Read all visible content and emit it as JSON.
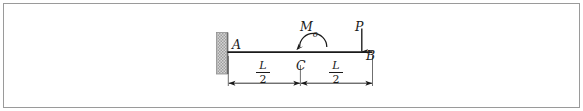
{
  "figure": {
    "type": "cantilever-beam-free-body-diagram",
    "background_color": "#ffffff",
    "frame_color": "#9a9a9a",
    "ink_color": "#1a1a1a",
    "wall_fill_color": "#b8b8b8",
    "wall_edge_color": "#6e6e6e"
  },
  "points": {
    "a_label": "A",
    "b_label": "B",
    "c_label": "C"
  },
  "loads": {
    "moment_symbol": "M",
    "moment_subscript": "o",
    "moment_direction": "counterclockwise",
    "force_label": "P",
    "force_direction": "downward"
  },
  "dimensions": {
    "left_span": {
      "numerator": "L",
      "denominator": "2"
    },
    "right_span": {
      "numerator": "L",
      "denominator": "2"
    }
  }
}
